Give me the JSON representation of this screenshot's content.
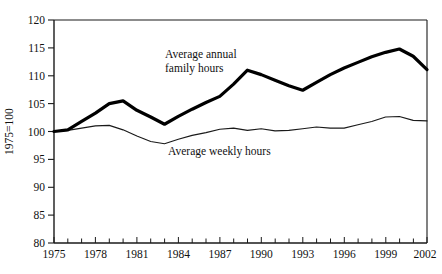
{
  "chart_data": {
    "type": "line",
    "title": "",
    "xlabel": "",
    "ylabel": "1975=100",
    "xlim": [
      1975,
      2002
    ],
    "ylim": [
      80,
      120
    ],
    "y_ticks": [
      80,
      85,
      90,
      95,
      100,
      105,
      110,
      115,
      120
    ],
    "x_ticks_labeled": [
      1975,
      1978,
      1981,
      1984,
      1987,
      1990,
      1993,
      1996,
      1999,
      2002
    ],
    "x_ticks_minor_step": 1,
    "grid": false,
    "legend": "inline-annotations",
    "x": [
      1975,
      1976,
      1977,
      1978,
      1979,
      1980,
      1981,
      1982,
      1983,
      1984,
      1985,
      1986,
      1987,
      1988,
      1989,
      1990,
      1991,
      1992,
      1993,
      1994,
      1995,
      1996,
      1997,
      1998,
      1999,
      2000,
      2001,
      2002
    ],
    "series": [
      {
        "name": "Average annual family hours",
        "style": "thick",
        "values": [
          100.0,
          100.3,
          101.8,
          103.3,
          105.0,
          105.5,
          103.8,
          102.6,
          101.3,
          102.7,
          104.0,
          105.2,
          106.3,
          108.5,
          111.0,
          110.2,
          109.2,
          108.2,
          107.4,
          108.8,
          110.2,
          111.4,
          112.4,
          113.4,
          114.2,
          114.8,
          113.5,
          111.1
        ]
      },
      {
        "name": "Average weekly hours",
        "style": "thin",
        "values": [
          100.0,
          100.2,
          100.6,
          101.0,
          101.1,
          100.3,
          99.2,
          98.2,
          97.8,
          98.6,
          99.3,
          99.8,
          100.4,
          100.6,
          100.2,
          100.5,
          100.1,
          100.2,
          100.5,
          100.8,
          100.6,
          100.6,
          101.2,
          101.8,
          102.6,
          102.7,
          102.0,
          101.9
        ]
      }
    ],
    "annotations": [
      {
        "id": "annot-family-hours",
        "text_line1": "Average annual",
        "text_line2": "family hours",
        "x": 165,
        "y": 58
      },
      {
        "id": "annot-weekly-hours",
        "text_line1": "Average weekly hours",
        "text_line2": "",
        "x": 168,
        "y": 152
      }
    ],
    "colors": {
      "thick_series": "#000000",
      "thin_series": "#1a1a1a",
      "axis": "#1a1a1a",
      "background": "#ffffff",
      "text": "#111111"
    }
  },
  "axis_labels": {
    "y_title": "1975=100",
    "y_tick_80": "80",
    "y_tick_85": "85",
    "y_tick_90": "90",
    "y_tick_95": "95",
    "y_tick_100": "100",
    "y_tick_105": "105",
    "y_tick_110": "110",
    "y_tick_115": "115",
    "y_tick_120": "120",
    "x_tick_1975": "1975",
    "x_tick_1978": "1978",
    "x_tick_1981": "1981",
    "x_tick_1984": "1984",
    "x_tick_1987": "1987",
    "x_tick_1990": "1990",
    "x_tick_1993": "1993",
    "x_tick_1996": "1996",
    "x_tick_1999": "1999",
    "x_tick_2002": "2002"
  },
  "annotation_text": {
    "family_line1": "Average annual",
    "family_line2": "family hours",
    "weekly_line1": "Average weekly hours"
  }
}
